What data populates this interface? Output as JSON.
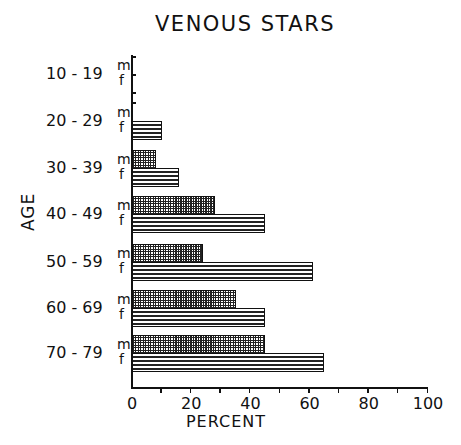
{
  "chart_data": {
    "type": "bar",
    "orientation": "horizontal",
    "title": "VENOUS STARS",
    "xlabel": "PERCENT",
    "ylabel": "AGE",
    "xlim": [
      0,
      100
    ],
    "xticks": [
      "0",
      "20",
      "40",
      "60",
      "80",
      "100"
    ],
    "categories": [
      "10 - 19",
      "20 - 29",
      "30 - 39",
      "40 - 49",
      "50 - 59",
      "60 - 69",
      "70 - 79"
    ],
    "series": [
      {
        "name": "m",
        "pattern": "crosshatch",
        "values": [
          0,
          0,
          8,
          28,
          24,
          35,
          45
        ]
      },
      {
        "name": "f",
        "pattern": "horizontal-lines",
        "values": [
          0,
          10,
          16,
          45,
          61,
          45,
          65
        ]
      }
    ],
    "grid": false,
    "legend": "inline sex labels (m / f) beside each age group"
  },
  "title": "VENOUS STARS",
  "ylabel": "AGE",
  "xlabel": "PERCENT",
  "xticks": [
    "0",
    "20",
    "40",
    "60",
    "80",
    "100"
  ],
  "sex_labels": {
    "m": "m",
    "f": "f"
  },
  "groups": [
    "10 - 19",
    "20 - 29",
    "30 - 39",
    "40 - 49",
    "50 - 59",
    "60 - 69",
    "70 - 79"
  ]
}
